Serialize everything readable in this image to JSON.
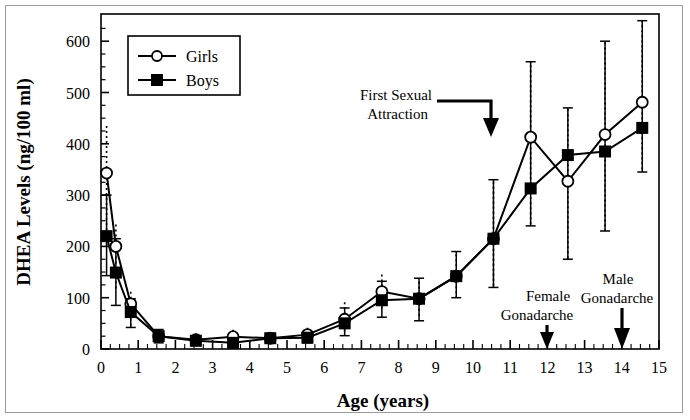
{
  "chart_data": {
    "type": "line",
    "title": "",
    "xlabel": "Age (years)",
    "ylabel": "DHEA Levels (ng/100 ml)",
    "xlim": [
      0,
      15
    ],
    "ylim": [
      0,
      650
    ],
    "yticks": [
      0,
      100,
      200,
      300,
      400,
      500,
      600
    ],
    "xticks": [
      0,
      1,
      2,
      3,
      4,
      5,
      6,
      7,
      8,
      9,
      10,
      11,
      12,
      13,
      14,
      15
    ],
    "grid": false,
    "legend_position": "top-left",
    "legend": [
      "Girls",
      "Boys"
    ],
    "series": [
      {
        "name": "Girls",
        "marker": "open-circle",
        "x": [
          0.15,
          0.4,
          0.8,
          1.55,
          2.55,
          3.55,
          4.55,
          5.55,
          6.55,
          7.55,
          8.55,
          9.55,
          10.55,
          11.55,
          12.55,
          13.55,
          14.55
        ],
        "values": [
          343,
          200,
          88,
          25,
          18,
          24,
          21,
          28,
          58,
          112,
          98,
          142,
          215,
          413,
          327,
          418,
          481
        ],
        "err_lo": [
          200,
          115,
          45,
          12,
          9,
          12,
          12,
          14,
          30,
          78,
          62,
          100,
          120,
          240,
          175,
          230,
          345
        ],
        "err_hi": [
          440,
          248,
          112,
          40,
          30,
          38,
          32,
          45,
          92,
          150,
          138,
          190,
          330,
          560,
          470,
          600,
          640
        ]
      },
      {
        "name": "Boys",
        "marker": "filled-square",
        "x": [
          0.15,
          0.4,
          0.8,
          1.55,
          2.55,
          3.55,
          4.55,
          5.55,
          6.55,
          7.55,
          8.55,
          9.55,
          10.55,
          11.55,
          12.55,
          13.55,
          14.55
        ],
        "values": [
          220,
          149,
          72,
          25,
          16,
          12,
          21,
          22,
          50,
          95,
          98,
          142,
          215,
          313,
          378,
          385,
          431
        ],
        "err_lo": [
          143,
          85,
          42,
          12,
          9,
          7,
          12,
          12,
          26,
          62,
          55,
          100,
          120,
          240,
          175,
          230,
          345
        ],
        "err_hi": [
          300,
          215,
          98,
          38,
          26,
          28,
          30,
          34,
          80,
          132,
          138,
          190,
          330,
          560,
          470,
          600,
          640
        ]
      }
    ],
    "annotations": [
      {
        "name": "first-sexual-attraction",
        "line1": "First Sexual",
        "line2": "Attraction",
        "points_to_x": 10.6,
        "arrow": "elbow-down"
      },
      {
        "name": "female-gonadarche",
        "line1": "Female",
        "line2": "Gonadarche",
        "points_to_x": 12,
        "arrow": "down"
      },
      {
        "name": "male-gonadarche",
        "line1": "Male",
        "line2": "Gonadarche",
        "points_to_x": 14,
        "arrow": "down"
      }
    ]
  },
  "colors": {
    "ink": "#000000",
    "frame": "#9a9a9a",
    "plot_bg": "#ffffff"
  }
}
